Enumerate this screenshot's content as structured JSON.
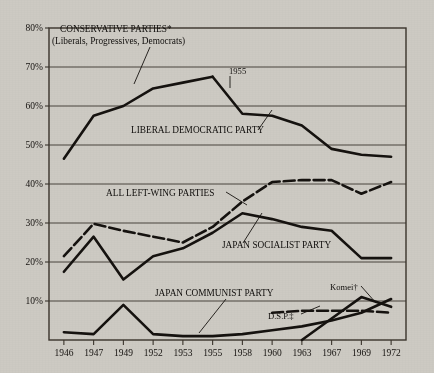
{
  "chart_data": {
    "type": "line",
    "title": "",
    "xlabel": "",
    "ylabel": "",
    "categories": [
      "1946",
      "1947",
      "1949",
      "1952",
      "1953",
      "1955",
      "1958",
      "1960",
      "1963",
      "1967",
      "1969",
      "1972"
    ],
    "ylim": [
      0,
      80
    ],
    "ytick_labels": [
      "10%",
      "20%",
      "30%",
      "40%",
      "50%",
      "60%",
      "70%",
      "80%"
    ],
    "yticks": [
      10,
      20,
      30,
      40,
      50,
      60,
      70,
      80
    ],
    "grid": "horizontal",
    "legend": "inline-annotations",
    "series": [
      {
        "name": "Conservative Parties (Liberals, Progressives, Democrats)",
        "style": "solid",
        "x": [
          "1946",
          "1947",
          "1949",
          "1952",
          "1953",
          "1955"
        ],
        "values": [
          46.5,
          57.5,
          60.0,
          64.5,
          66.0,
          67.5
        ]
      },
      {
        "name": "Liberal Democratic Party",
        "style": "solid",
        "x": [
          "1955",
          "1958",
          "1960",
          "1963",
          "1967",
          "1969",
          "1972"
        ],
        "values": [
          67.5,
          58.0,
          57.5,
          55.0,
          49.0,
          47.5,
          47.0
        ]
      },
      {
        "name": "All Left-Wing Parties",
        "style": "dashed",
        "x": [
          "1946",
          "1947",
          "1949",
          "1952",
          "1953",
          "1955",
          "1958",
          "1960",
          "1963",
          "1967",
          "1969",
          "1972"
        ],
        "values": [
          21.5,
          29.8,
          28.0,
          26.5,
          25.0,
          29.0,
          35.5,
          40.5,
          41.0,
          41.0,
          37.5,
          40.5
        ]
      },
      {
        "name": "Japan Socialist Party",
        "style": "solid",
        "x": [
          "1946",
          "1947",
          "1949",
          "1952",
          "1953",
          "1955",
          "1958",
          "1960",
          "1963",
          "1967",
          "1969",
          "1972"
        ],
        "values": [
          17.5,
          26.5,
          15.5,
          21.5,
          23.5,
          27.5,
          32.5,
          31.0,
          29.0,
          28.0,
          21.0,
          21.0
        ]
      },
      {
        "name": "Japan Communist Party",
        "style": "solid",
        "x": [
          "1946",
          "1947",
          "1949",
          "1952",
          "1953",
          "1955",
          "1958",
          "1960",
          "1963",
          "1967",
          "1969",
          "1972"
        ],
        "values": [
          2.0,
          1.5,
          9.0,
          1.5,
          1.0,
          1.0,
          1.5,
          2.5,
          3.5,
          5.0,
          7.0,
          10.5
        ]
      },
      {
        "name": "D.S.P.",
        "style": "dashed",
        "x": [
          "1960",
          "1963",
          "1967",
          "1969",
          "1972"
        ],
        "values": [
          7.0,
          7.5,
          7.5,
          7.5,
          7.0
        ]
      },
      {
        "name": "Komeito",
        "style": "solid",
        "x": [
          "1963",
          "1967",
          "1969",
          "1972"
        ],
        "values": [
          0.0,
          5.5,
          11.0,
          8.5
        ]
      }
    ],
    "annotations": [
      {
        "id": "conservative",
        "line1": "CONSERVATIVE PARTIES*",
        "line2": "(Liberals, Progressives, Democrats)"
      },
      {
        "id": "ldp",
        "text": "LIBERAL DEMOCRATIC PARTY"
      },
      {
        "id": "left-wing",
        "text": "ALL LEFT-WING PARTIES"
      },
      {
        "id": "jsp",
        "text": "JAPAN SOCIALIST PARTY"
      },
      {
        "id": "jcp",
        "text": "JAPAN COMMUNIST PARTY"
      },
      {
        "id": "dsp",
        "text": "D.S.P.‡"
      },
      {
        "id": "komeito",
        "text": "Komei†"
      },
      {
        "id": "year-marker",
        "text": "1955"
      }
    ],
    "colors": {
      "background": "#cdcac3",
      "line": "#15120f",
      "grid": "#3a342c",
      "text": "#15120f"
    }
  }
}
